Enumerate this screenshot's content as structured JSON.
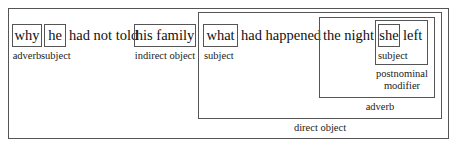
{
  "diagram": {
    "type": "sentence-constituent-box-diagram",
    "sentence": "why he had not told his family what had happened the night she left",
    "words": {
      "why": "why",
      "he": "he",
      "had_not_told": "had not told",
      "his_family": "his family",
      "what": "what",
      "had_happened": "had happened",
      "the_night": "the night",
      "she": "she",
      "left": "left"
    },
    "labels": {
      "why": "adverb",
      "he": "subject",
      "his_family": "indirect object",
      "what": "subject",
      "she": "subject",
      "postnominal_line1": "postnominal",
      "postnominal_line2": "modifier",
      "adverb_clause": "adverb",
      "direct_object": "direct object"
    },
    "colors": {
      "border": "#555555",
      "text": "#111111",
      "background": "#ffffff"
    }
  }
}
